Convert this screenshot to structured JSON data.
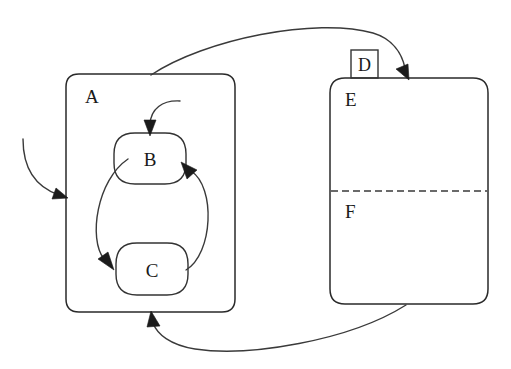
{
  "diagram": {
    "type": "statechart",
    "title": "",
    "background_color": "#ffffff",
    "line_color": "#2a2a2a",
    "text_color": "#1a1a1a",
    "states": [
      {
        "id": "A",
        "label": "A",
        "kind": "composite-state",
        "shape": "rounded-rectangle",
        "label_position": "top-left",
        "bounds": {
          "x": 66,
          "y": 74,
          "width": 169,
          "height": 238,
          "radius": 13
        }
      },
      {
        "id": "B",
        "label": "B",
        "kind": "simple-state",
        "shape": "rounded-rectangle",
        "label_position": "center",
        "parent": "A",
        "bounds": {
          "x": 114,
          "y": 133,
          "width": 72,
          "height": 51,
          "radius": 21
        }
      },
      {
        "id": "C",
        "label": "C",
        "kind": "simple-state",
        "shape": "rounded-rectangle",
        "label_position": "center",
        "parent": "A",
        "bounds": {
          "x": 116,
          "y": 243,
          "width": 72,
          "height": 52,
          "radius": 21
        }
      },
      {
        "id": "D",
        "label": "D",
        "kind": "entry-point-label",
        "shape": "square",
        "label_position": "center",
        "bounds": {
          "x": 351,
          "y": 50,
          "width": 27,
          "height": 28,
          "radius": 0
        }
      },
      {
        "id": "E",
        "label": "E",
        "kind": "composite-state",
        "shape": "rounded-rectangle",
        "label_position": "top-left",
        "bounds": {
          "x": 330,
          "y": 78,
          "width": 158,
          "height": 226,
          "radius": 15
        }
      },
      {
        "id": "F",
        "label": "F",
        "kind": "orthogonal-region",
        "shape": "region",
        "label_position": "top-left",
        "parent": "E",
        "bounds": {
          "x": 330,
          "y": 191,
          "width": 158,
          "height": 113,
          "radius": 0
        }
      }
    ],
    "regions": [
      {
        "id": "E-F-divider",
        "kind": "dashed-region-divider",
        "parent": "E",
        "y": 191,
        "x_start": 331,
        "x_end": 487,
        "style": "dashed"
      }
    ],
    "transitions": [
      {
        "id": "initial-to-A",
        "kind": "initial-transition",
        "source": "",
        "target": "A",
        "label": "",
        "arrowhead": "filled-triangle",
        "path": "M 23,139 C 23,166 34,186 63,196",
        "arrow_at": {
          "x": 66,
          "y": 197,
          "angle": 24
        }
      },
      {
        "id": "initial-to-B",
        "kind": "initial-transition",
        "source": "",
        "target": "B",
        "label": "",
        "arrowhead": "filled-triangle",
        "path": "M 179,101 C 162,101 151,110 150,127",
        "arrow_at": {
          "x": 150,
          "y": 134,
          "angle": 92
        }
      },
      {
        "id": "B-to-C",
        "kind": "transition",
        "source": "B",
        "target": "C",
        "label": "",
        "arrowhead": "filled-triangle",
        "path": "M 127,160 C 96,181 88,240 105,262",
        "arrow_at": {
          "x": 113,
          "y": 268,
          "angle": 45
        }
      },
      {
        "id": "C-to-B",
        "kind": "transition",
        "source": "C",
        "target": "B",
        "label": "",
        "arrowhead": "filled-triangle",
        "path": "M 186,270 C 212,255 215,186 189,169",
        "arrow_at": {
          "x": 183,
          "y": 165,
          "angle": -145
        }
      },
      {
        "id": "A-to-E",
        "kind": "transition",
        "source": "A",
        "target": "E",
        "label": "",
        "arrowhead": "filled-triangle",
        "path": "M 151,75 C 206,40 315,18 372,33 C 394,39 403,55 406,70",
        "arrow_at": {
          "x": 408,
          "y": 78,
          "angle": 72
        }
      },
      {
        "id": "E-to-A",
        "kind": "transition",
        "source": "E",
        "target": "A",
        "label": "",
        "arrowhead": "filled-triangle",
        "path": "M 406,305 C 350,340 250,356 196,349 C 170,345 156,333 152,321",
        "arrow_at": {
          "x": 151,
          "y": 313,
          "angle": -110
        }
      }
    ]
  }
}
